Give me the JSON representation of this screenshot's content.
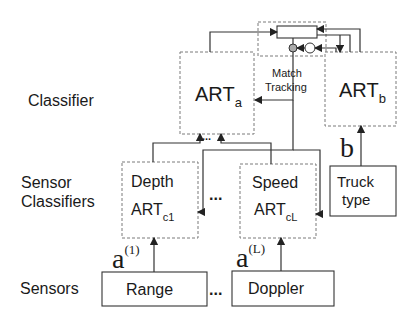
{
  "levels": {
    "classifier": "Classifier",
    "sensor_classifiers_line1": "Sensor",
    "sensor_classifiers_line2": "Classifiers",
    "sensors": "Sensors"
  },
  "art_a": {
    "main": "ART",
    "sub": "a"
  },
  "art_b": {
    "main": "ART",
    "sub": "b"
  },
  "match_tracking": {
    "line1": "Match",
    "line2": "Tracking"
  },
  "depth": {
    "title": "Depth",
    "main": "ART",
    "sub": "c1"
  },
  "speed": {
    "title": "Speed",
    "main": "ART",
    "sub": "cL"
  },
  "truck": {
    "line1": "Truck",
    "line2": "type"
  },
  "sensor_boxes": {
    "range": "Range",
    "doppler": "Doppler"
  },
  "signals": {
    "a1_base": "a",
    "a1_sup": "(1)",
    "aL_base": "a",
    "aL_sup": "(L)",
    "b": "b"
  },
  "ellipsis": "..."
}
